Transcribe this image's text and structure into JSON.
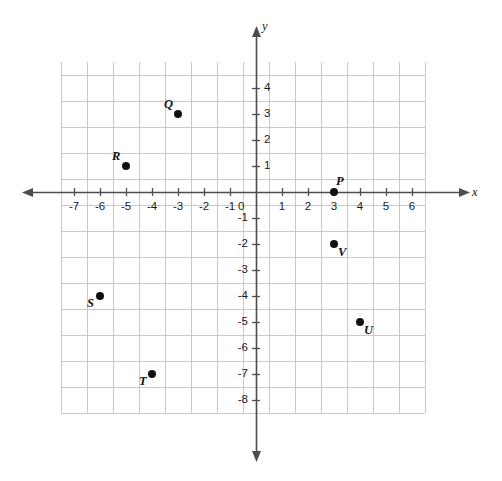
{
  "chart_data": {
    "type": "scatter",
    "title": "",
    "xlabel": "x",
    "ylabel": "y",
    "xlim": [
      -7.5,
      6.5
    ],
    "ylim": [
      -8.5,
      5
    ],
    "grid": true,
    "legend": "none",
    "x_ticks": [
      "-7",
      "-6",
      "-5",
      "-4",
      "-3",
      "-2",
      "-1",
      "0",
      "1",
      "2",
      "3",
      "4",
      "5",
      "6"
    ],
    "x_tick_values": [
      -7,
      -6,
      -5,
      -4,
      -3,
      -2,
      -1,
      0,
      1,
      2,
      3,
      4,
      5,
      6
    ],
    "y_ticks": [
      "4",
      "3",
      "2",
      "1",
      "0",
      "-1",
      "-2",
      "-3",
      "-4",
      "-5",
      "-6",
      "-7",
      "-8"
    ],
    "y_tick_values": [
      4,
      3,
      2,
      1,
      0,
      -1,
      -2,
      -3,
      -4,
      -5,
      -6,
      -7,
      -8
    ],
    "origin_label": "0",
    "points": [
      {
        "label": "Q",
        "x": -3,
        "y": 3,
        "label_pos": "upper-left"
      },
      {
        "label": "R",
        "x": -5,
        "y": 1,
        "label_pos": "upper-left"
      },
      {
        "label": "P",
        "x": 3,
        "y": 0,
        "label_pos": "upper-right"
      },
      {
        "label": "V",
        "x": 3,
        "y": -2,
        "label_pos": "lower-right"
      },
      {
        "label": "S",
        "x": -6,
        "y": -4,
        "label_pos": "lower-left"
      },
      {
        "label": "U",
        "x": 4,
        "y": -5,
        "label_pos": "lower-right"
      },
      {
        "label": "T",
        "x": -4,
        "y": -7,
        "label_pos": "lower-left"
      }
    ],
    "colors": {
      "grid": "#c9c9c9",
      "axis": "#4d4d4d",
      "point": "#111111",
      "text": "#1a1a1a",
      "background": "#ffffff"
    }
  }
}
